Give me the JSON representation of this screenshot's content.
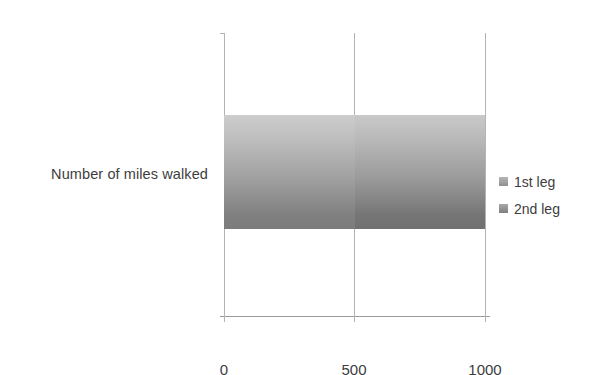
{
  "chart_data": {
    "type": "bar",
    "orientation": "horizontal",
    "stacked": true,
    "title": "",
    "subtitle": "",
    "xlabel": "",
    "ylabel": "",
    "categories": [
      "Number of miles walked"
    ],
    "series": [
      {
        "name": "1st leg",
        "values": [
          500
        ],
        "color": "#9e9e9e"
      },
      {
        "name": "2nd leg",
        "values": [
          500
        ],
        "color": "#989898"
      }
    ],
    "xlim": [
      0,
      1000
    ],
    "xticks": [
      0,
      500,
      1000
    ],
    "xtick_labels": [
      "0",
      "500",
      "1000"
    ],
    "grid": true,
    "grid_axis": "x",
    "legend_position": "right",
    "total": 1000
  },
  "axis": {
    "category_label": "Number of miles walked",
    "ticks": [
      {
        "label": "0",
        "value": 0
      },
      {
        "label": "500",
        "value": 500
      },
      {
        "label": "1000",
        "value": 1000
      }
    ]
  },
  "legend": {
    "entries": [
      {
        "label": "1st leg",
        "swatch_color": "#9e9e9e"
      },
      {
        "label": "2nd leg",
        "swatch_color": "#8f8f8f"
      }
    ]
  },
  "colors": {
    "gridline": "#b4b4b4",
    "baseline": "#9a9a9a",
    "text": "#3d3d3d",
    "background": "#ffffff",
    "bar_top": "#cdcdcd",
    "bar_bottom": "#7c7c7c"
  }
}
